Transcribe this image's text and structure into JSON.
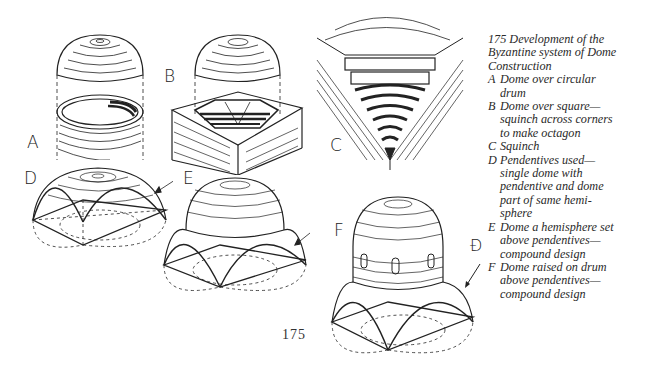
{
  "figure": {
    "number": "175",
    "title_lines": [
      "175  Development of the",
      "Byzantine system of Dome",
      "Construction"
    ],
    "panels": [
      {
        "key": "A",
        "label": "A",
        "lines": [
          "Dome over circular",
          "drum"
        ]
      },
      {
        "key": "B",
        "label": "B",
        "lines": [
          "Dome over square—",
          "squinch across corners",
          "to make octagon"
        ]
      },
      {
        "key": "C",
        "label": "C",
        "lines": [
          "Squinch"
        ]
      },
      {
        "key": "D",
        "label": "D",
        "lines": [
          "Pendentives used—",
          "single dome with",
          "pendentive and dome",
          "part of same hemi-",
          "sphere"
        ]
      },
      {
        "key": "E",
        "label": "E",
        "lines": [
          "Dome a hemisphere set",
          "above pendentives—",
          "compound design"
        ]
      },
      {
        "key": "F",
        "label": "F",
        "lines": [
          "Dome raised on drum",
          "above pendentives—",
          "compound design"
        ]
      }
    ],
    "annotation_symbol": "Ɖ"
  },
  "page": {
    "number": "175"
  },
  "colors": {
    "ink": "#222222",
    "paper": "#ffffff"
  }
}
